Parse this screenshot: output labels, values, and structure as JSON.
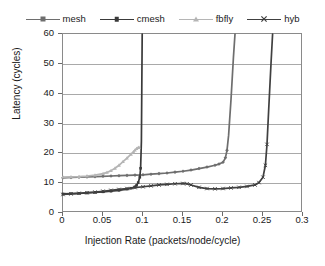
{
  "chart_data": {
    "type": "line",
    "title": "",
    "xlabel": "Injection Rate (packets/node/cycle)",
    "ylabel": "Latency (cycles)",
    "xlim": [
      0,
      0.3
    ],
    "ylim": [
      0,
      60
    ],
    "xticks": [
      "0",
      "0.05",
      "0.1",
      "0.15",
      "0.2",
      "0.25",
      "0.3"
    ],
    "xtick_values": [
      0,
      0.05,
      0.1,
      0.15,
      0.2,
      0.25,
      0.3
    ],
    "yticks": [
      "0",
      "10",
      "20",
      "30",
      "40",
      "50",
      "60"
    ],
    "ytick_values": [
      0,
      10,
      20,
      30,
      40,
      50,
      60
    ],
    "grid": "horizontal",
    "legend_position": "top-center",
    "series": [
      {
        "name": "mesh",
        "color": "#6e6e6e",
        "marker": "diamond",
        "x": [
          0,
          0.01,
          0.02,
          0.03,
          0.04,
          0.05,
          0.06,
          0.07,
          0.08,
          0.09,
          0.1,
          0.11,
          0.12,
          0.13,
          0.14,
          0.15,
          0.16,
          0.17,
          0.18,
          0.19,
          0.195,
          0.2,
          0.203,
          0.205,
          0.207,
          0.21,
          0.213,
          0.215
        ],
        "y": [
          11.8,
          11.9,
          12.0,
          12.1,
          12.2,
          12.3,
          12.4,
          12.5,
          12.6,
          12.7,
          12.8,
          13.0,
          13.2,
          13.4,
          13.7,
          14.0,
          14.4,
          14.9,
          15.4,
          16.0,
          16.4,
          17.0,
          18.5,
          21.0,
          26.0,
          38.0,
          52.0,
          60.0
        ]
      },
      {
        "name": "cmesh",
        "color": "#3a3a3a",
        "marker": "square",
        "x": [
          0,
          0.01,
          0.02,
          0.03,
          0.04,
          0.05,
          0.06,
          0.07,
          0.08,
          0.085,
          0.09,
          0.092,
          0.094,
          0.096,
          0.097,
          0.098,
          0.0985,
          0.099
        ],
        "y": [
          6.4,
          6.5,
          6.6,
          6.7,
          6.9,
          7.1,
          7.3,
          7.6,
          8.0,
          8.3,
          8.8,
          9.3,
          10.2,
          12.0,
          15.0,
          24.0,
          42.0,
          60.0
        ]
      },
      {
        "name": "fbfly",
        "color": "#b5b5b5",
        "marker": "triangle",
        "x": [
          0,
          0.01,
          0.02,
          0.03,
          0.04,
          0.05,
          0.055,
          0.06,
          0.065,
          0.07,
          0.075,
          0.08,
          0.085,
          0.088,
          0.09,
          0.092,
          0.094,
          0.095
        ],
        "y": [
          12.0,
          12.1,
          12.2,
          12.4,
          12.7,
          13.2,
          13.6,
          14.2,
          15.0,
          16.0,
          17.2,
          18.4,
          19.7,
          20.5,
          21.1,
          21.6,
          21.9,
          22.0
        ]
      },
      {
        "name": "hyb",
        "color": "#404040",
        "marker": "x",
        "x": [
          0,
          0.01,
          0.02,
          0.03,
          0.04,
          0.05,
          0.06,
          0.07,
          0.08,
          0.09,
          0.1,
          0.11,
          0.12,
          0.13,
          0.14,
          0.15,
          0.155,
          0.16,
          0.17,
          0.18,
          0.19,
          0.2,
          0.21,
          0.22,
          0.23,
          0.24,
          0.245,
          0.25,
          0.253,
          0.255,
          0.257,
          0.26,
          0.262
        ],
        "y": [
          6.2,
          6.4,
          6.6,
          6.8,
          7.0,
          7.3,
          7.6,
          7.9,
          8.2,
          8.5,
          8.8,
          9.1,
          9.4,
          9.6,
          9.8,
          9.9,
          9.8,
          9.4,
          8.6,
          8.2,
          8.1,
          8.2,
          8.4,
          8.6,
          8.9,
          9.4,
          10.2,
          12.0,
          16.0,
          23.0,
          34.0,
          50.0,
          60.0
        ]
      }
    ]
  },
  "legend": {
    "items": [
      {
        "label": "mesh"
      },
      {
        "label": "cmesh"
      },
      {
        "label": "fbfly"
      },
      {
        "label": "hyb"
      }
    ]
  },
  "axes": {
    "x_title": "Injection Rate (packets/node/cycle)",
    "y_title": "Latency (cycles)"
  }
}
